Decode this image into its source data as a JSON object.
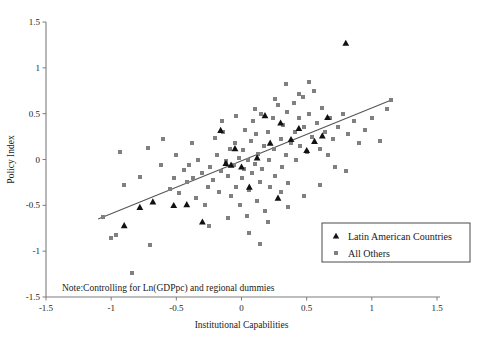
{
  "figure": {
    "note": "Note:Controlling for Ln(GDPpc) and regional dummies",
    "colors": {
      "square_marker": "#808080",
      "triangle_marker": "#111111",
      "axis": "#7c7c7c",
      "trend_line": "#555555",
      "legend_border": "#4a4a4a",
      "background": "#ffffff"
    }
  },
  "legend": {
    "position": "bottom-right",
    "entries": [
      {
        "label": "Latin American Countries",
        "marker": "triangle-marker-icon",
        "color": "#111111"
      },
      {
        "label": "All Others",
        "marker": "square-marker-icon",
        "color": "#808080"
      }
    ]
  },
  "chart_data": {
    "type": "scatter",
    "title": "",
    "xlabel": "Institutional Capabilities",
    "ylabel": "Policy Index",
    "xlim": [
      -1.5,
      1.5
    ],
    "ylim": [
      -1.5,
      1.5
    ],
    "xticks": [
      -1.5,
      -1,
      -0.5,
      0,
      0.5,
      1,
      1.5
    ],
    "xtick_labels": [
      "-1.5",
      "-1",
      "-0.5",
      "0",
      "0.5",
      "1",
      "1.5"
    ],
    "yticks": [
      -1.5,
      -1,
      -0.5,
      0,
      0.5,
      1,
      1.5
    ],
    "ytick_labels": [
      "-1.5",
      "-1",
      "-0.5",
      "0",
      "0.5",
      "1",
      "1.5"
    ],
    "grid": false,
    "trend_line": {
      "x": [
        -1.1,
        1.15
      ],
      "y": [
        -0.65,
        0.65
      ],
      "slope": 0.578,
      "intercept": -0.0143
    },
    "series": [
      {
        "name": "All Others",
        "marker": "square",
        "color": "#808080",
        "points": [
          [
            -0.93,
            0.08
          ],
          [
            -0.72,
            0.13
          ],
          [
            -0.9,
            -0.28
          ],
          [
            -0.78,
            -0.19
          ],
          [
            -0.62,
            -0.06
          ],
          [
            -0.55,
            -0.32
          ],
          [
            -0.52,
            -0.2
          ],
          [
            -1.06,
            -0.63
          ],
          [
            -1.0,
            -0.86
          ],
          [
            -0.96,
            -0.82
          ],
          [
            -0.84,
            -1.24
          ],
          [
            -0.7,
            -0.93
          ],
          [
            -0.48,
            -0.36
          ],
          [
            -0.44,
            -0.11
          ],
          [
            -0.42,
            -0.24
          ],
          [
            -0.4,
            -0.06
          ],
          [
            -0.37,
            -0.2
          ],
          [
            -0.35,
            -0.42
          ],
          [
            -0.33,
            0.0
          ],
          [
            -0.3,
            -0.15
          ],
          [
            -0.28,
            -0.5
          ],
          [
            -0.26,
            -0.3
          ],
          [
            -0.24,
            -0.08
          ],
          [
            -0.22,
            -0.22
          ],
          [
            -0.2,
            0.24
          ],
          [
            -0.19,
            0.05
          ],
          [
            -0.17,
            -0.35
          ],
          [
            -0.16,
            -0.12
          ],
          [
            -0.14,
            0.3
          ],
          [
            -0.12,
            -0.02
          ],
          [
            -0.1,
            -0.18
          ],
          [
            -0.09,
            0.12
          ],
          [
            -0.08,
            -0.4
          ],
          [
            -0.06,
            -0.06
          ],
          [
            -0.05,
            0.18
          ],
          [
            -0.04,
            -0.3
          ],
          [
            -0.02,
            0.02
          ],
          [
            -0.01,
            -0.5
          ],
          [
            0.0,
            -0.2
          ],
          [
            0.01,
            0.1
          ],
          [
            0.02,
            -0.1
          ],
          [
            0.03,
            0.32
          ],
          [
            0.04,
            -0.62
          ],
          [
            0.05,
            0.0
          ],
          [
            0.06,
            -0.33
          ],
          [
            0.07,
            0.2
          ],
          [
            0.08,
            -0.15
          ],
          [
            0.09,
            0.42
          ],
          [
            0.1,
            -0.05
          ],
          [
            0.11,
            0.28
          ],
          [
            0.12,
            -0.45
          ],
          [
            0.13,
            0.06
          ],
          [
            0.14,
            -0.25
          ],
          [
            0.15,
            0.5
          ],
          [
            0.16,
            -0.1
          ],
          [
            0.17,
            0.15
          ],
          [
            0.18,
            -0.56
          ],
          [
            0.2,
            0.3
          ],
          [
            0.21,
            0.0
          ],
          [
            0.22,
            -0.3
          ],
          [
            0.24,
            0.45
          ],
          [
            0.25,
            0.12
          ],
          [
            0.26,
            -0.18
          ],
          [
            0.28,
            0.6
          ],
          [
            0.3,
            0.22
          ],
          [
            0.31,
            -0.08
          ],
          [
            0.32,
            0.38
          ],
          [
            0.34,
            0.05
          ],
          [
            0.35,
            0.52
          ],
          [
            0.36,
            -0.26
          ],
          [
            0.38,
            0.18
          ],
          [
            0.4,
            0.62
          ],
          [
            0.41,
            0.3
          ],
          [
            0.42,
            0.0
          ],
          [
            0.44,
            0.45
          ],
          [
            0.45,
            0.15
          ],
          [
            0.47,
            0.68
          ],
          [
            0.48,
            0.35
          ],
          [
            0.5,
            0.08
          ],
          [
            0.52,
            0.5
          ],
          [
            0.54,
            0.25
          ],
          [
            0.56,
            0.75
          ],
          [
            0.58,
            0.4
          ],
          [
            0.6,
            0.12
          ],
          [
            0.62,
            0.56
          ],
          [
            0.64,
            0.3
          ],
          [
            0.66,
            0.05
          ],
          [
            0.68,
            0.45
          ],
          [
            0.7,
            0.22
          ],
          [
            0.74,
            0.35
          ],
          [
            0.78,
            0.5
          ],
          [
            0.82,
            0.28
          ],
          [
            0.86,
            0.42
          ],
          [
            0.9,
            0.18
          ],
          [
            0.95,
            0.32
          ],
          [
            1.0,
            0.45
          ],
          [
            1.06,
            0.2
          ],
          [
            1.12,
            0.55
          ],
          [
            1.15,
            0.65
          ],
          [
            0.72,
            -0.08
          ],
          [
            0.8,
            -0.12
          ],
          [
            0.6,
            -0.28
          ],
          [
            0.48,
            -0.4
          ],
          [
            0.36,
            -0.52
          ],
          [
            0.2,
            -0.68
          ],
          [
            0.06,
            -0.8
          ],
          [
            -0.1,
            -0.64
          ],
          [
            -0.25,
            -0.72
          ],
          [
            0.14,
            -0.92
          ],
          [
            0.3,
            -0.35
          ],
          [
            -0.38,
            0.18
          ],
          [
            -0.5,
            0.05
          ],
          [
            -0.6,
            0.22
          ],
          [
            0.44,
            0.72
          ],
          [
            0.26,
            0.66
          ],
          [
            0.1,
            0.55
          ],
          [
            -0.04,
            0.48
          ],
          [
            -0.15,
            0.42
          ],
          [
            0.34,
            0.82
          ],
          [
            0.52,
            0.85
          ]
        ]
      },
      {
        "name": "Latin American Countries",
        "marker": "triangle",
        "color": "#111111",
        "points": [
          [
            0.8,
            1.27
          ],
          [
            -0.9,
            -0.72
          ],
          [
            -0.52,
            -0.5
          ],
          [
            -0.42,
            -0.49
          ],
          [
            -0.16,
            0.32
          ],
          [
            -0.05,
            0.12
          ],
          [
            -0.12,
            -0.04
          ],
          [
            -0.08,
            -0.06
          ],
          [
            0.0,
            -0.08
          ],
          [
            0.06,
            -0.3
          ],
          [
            0.18,
            0.48
          ],
          [
            0.22,
            0.18
          ],
          [
            0.3,
            0.4
          ],
          [
            0.38,
            0.22
          ],
          [
            0.44,
            0.34
          ],
          [
            0.5,
            0.1
          ],
          [
            0.56,
            0.2
          ],
          [
            0.62,
            0.26
          ],
          [
            0.28,
            -0.42
          ],
          [
            -0.68,
            -0.46
          ],
          [
            -0.78,
            -0.52
          ],
          [
            0.66,
            0.46
          ],
          [
            0.12,
            0.02
          ],
          [
            -0.3,
            -0.68
          ]
        ]
      }
    ]
  }
}
